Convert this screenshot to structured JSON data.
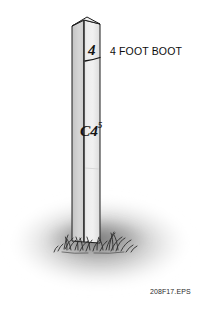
{
  "figure": {
    "caption": "208F17.EPS",
    "callout": "4 FOOT BOOT",
    "post": {
      "top_marking": "4",
      "body_marking": "C4",
      "body_marking_superscript": "5"
    },
    "colors": {
      "post_front_face": "#e9e9e9",
      "post_side_face": "#cfcfcf",
      "post_top_face": "#f4f4f4",
      "outline": "#1a1a1a",
      "ground_shadow": "#b9b9b9",
      "grass": "#333333",
      "text": "#0d0d0d",
      "caption_text": "#2a2a2a",
      "background": "#ffffff"
    }
  }
}
